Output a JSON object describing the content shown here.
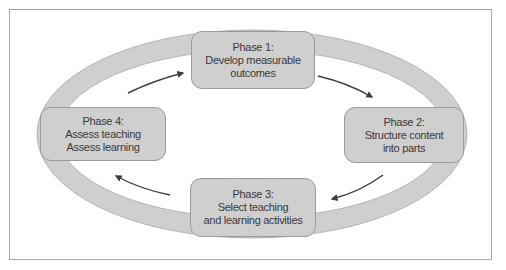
{
  "diagram": {
    "type": "cycle",
    "colors": {
      "box_fill": "#cfcfcf",
      "box_border": "#9a9a9a",
      "ring_fill": "#cfcfcf",
      "arrow": "#3d3d3d",
      "text": "#3a3a3a",
      "frame": "#a9a9a9"
    },
    "phases": [
      {
        "title": "Phase 1:",
        "lines": [
          "Develop measurable",
          "outcomes"
        ]
      },
      {
        "title": "Phase 2:",
        "lines": [
          "Structure content",
          "into parts"
        ]
      },
      {
        "title": "Phase 3:",
        "lines": [
          "Select teaching",
          "and learning activities"
        ]
      },
      {
        "title": "Phase 4:",
        "lines": [
          "Assess teaching",
          "Assess learning"
        ]
      }
    ],
    "flow": [
      "Phase 1",
      "Phase 2",
      "Phase 3",
      "Phase 4",
      "Phase 1"
    ],
    "direction": "clockwise"
  }
}
